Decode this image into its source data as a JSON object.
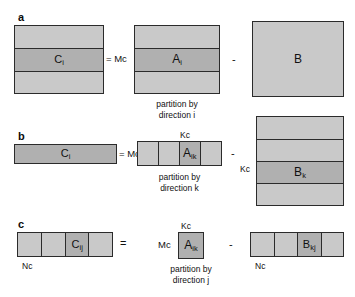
{
  "figure": {
    "background": "#ffffff",
    "block_fill": "#c9c9c9",
    "block_fill_selected": "#b0b0b0",
    "block_stroke": "#2b2b2b"
  },
  "panels": [
    {
      "letter": "a",
      "caption_line1": "partition by",
      "caption_line2": "direction i",
      "equals_label": "= Mc",
      "minus_label": "-",
      "left": {
        "name": "C",
        "label_main": "C",
        "label_sub": "i",
        "rows": 3,
        "selected_row": 1
      },
      "middle": {
        "name": "A",
        "label_main": "A",
        "label_sub": "i",
        "rows": 3,
        "selected_row": 1
      },
      "right": {
        "name": "B",
        "label_main": "B",
        "label_sub": "",
        "rows": 1,
        "selected_row": -1
      }
    },
    {
      "letter": "b",
      "caption_line1": "partition by",
      "caption_line2": "direction k",
      "equals_label": "= Mc",
      "minus_label": "-",
      "dim_top": "Kc",
      "dim_left": "Kc",
      "left": {
        "name": "C",
        "label_main": "C",
        "label_sub": "i",
        "cols": 1,
        "selected_col": 0
      },
      "middle": {
        "name": "A",
        "label_main": "A",
        "label_sub": "ik",
        "cols": 4,
        "selected_col": 2
      },
      "right": {
        "name": "B",
        "label_main": "B",
        "label_sub": "k",
        "rows": 4,
        "selected_row": 2
      }
    },
    {
      "letter": "c",
      "caption_line1": "partition by",
      "caption_line2": "direction j",
      "equals_label": "=",
      "mc_label": "Mc",
      "minus_label": "-",
      "dim_top": "Kc",
      "dim_left_c": "Nc",
      "dim_left_b": "Nc",
      "left": {
        "name": "C",
        "label_main": "C",
        "label_sub": "ij",
        "cols": 4,
        "selected_col": 2
      },
      "middle": {
        "name": "A",
        "label_main": "A",
        "label_sub": "ik"
      },
      "right": {
        "name": "B",
        "label_main": "B",
        "label_sub": "kj",
        "cols": 4,
        "selected_col": 2
      }
    }
  ]
}
